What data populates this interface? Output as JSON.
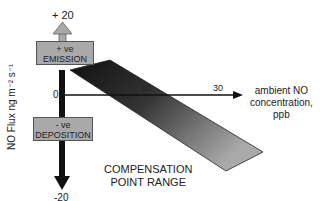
{
  "y_axis": {
    "label": "NO Flux ng m⁻² s⁻¹",
    "top_tick": "+ 20",
    "zero_tick": "0",
    "bottom_tick": "-20"
  },
  "x_axis": {
    "tick_10": "10",
    "tick_30": "30",
    "label_line1": "ambient NO",
    "label_line2": "concentration,",
    "label_line3": "ppb"
  },
  "emission_box": {
    "line1": "+ ve",
    "line2": "EMISSION"
  },
  "deposition_box": {
    "line1": "- ve",
    "line2": "DEPOSITION"
  },
  "band_label": {
    "line1": "COMPENSATION",
    "line2": "POINT RANGE"
  },
  "colors": {
    "up_arrow": "#a9a9a9",
    "axis": "#111111",
    "box_fill": "#a9a9a9"
  }
}
